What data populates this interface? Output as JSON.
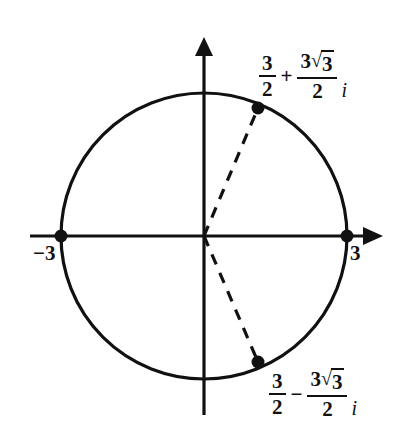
{
  "figure": {
    "type": "complex-plane-diagram",
    "background_color": "#ffffff",
    "stroke_color": "#111111"
  },
  "axes": {
    "real_axis": {
      "name": "horizontal-axis",
      "has_arrow_right": true,
      "has_arrow_left": false,
      "x_start": 30,
      "x_end": 382,
      "y": 236
    },
    "imaginary_axis": {
      "name": "vertical-axis",
      "has_arrow_up": true,
      "has_arrow_down": false,
      "y_start": 38,
      "y_end": 415,
      "x": 204
    },
    "origin": {
      "x": 204,
      "y": 236
    }
  },
  "circle": {
    "center_x": 204,
    "center_y": 236,
    "radius": 143,
    "radius_value": 3,
    "dashed": false
  },
  "intercepts": [
    {
      "label": "−3",
      "value": -3,
      "x": 61,
      "y": 236,
      "marker": "filled-dot"
    },
    {
      "label": "3",
      "value": 3,
      "x": 347,
      "y": 236,
      "marker": "filled-dot"
    }
  ],
  "points": [
    {
      "id": "upper-root",
      "x": 258,
      "y": 108,
      "marker": "filled-dot",
      "label": {
        "real_num": "3",
        "real_den": "2",
        "operator": "+",
        "imag_coefficient": "3",
        "radical_symbol": "√",
        "radicand": "3",
        "imag_den": "2",
        "imaginary_unit": "i"
      }
    },
    {
      "id": "lower-root",
      "x": 258,
      "y": 362,
      "marker": "filled-dot",
      "label": {
        "real_num": "3",
        "real_den": "2",
        "operator": "−",
        "imag_coefficient": "3",
        "radical_symbol": "√",
        "radicand": "3",
        "imag_den": "2",
        "imaginary_unit": "i"
      }
    }
  ],
  "dashed_segments": [
    {
      "id": "radius-to-upper-root",
      "from_x": 204,
      "from_y": 236,
      "to_x": 258,
      "to_y": 108
    },
    {
      "id": "radius-to-lower-root",
      "from_x": 204,
      "from_y": 236,
      "to_x": 258,
      "to_y": 362
    }
  ]
}
